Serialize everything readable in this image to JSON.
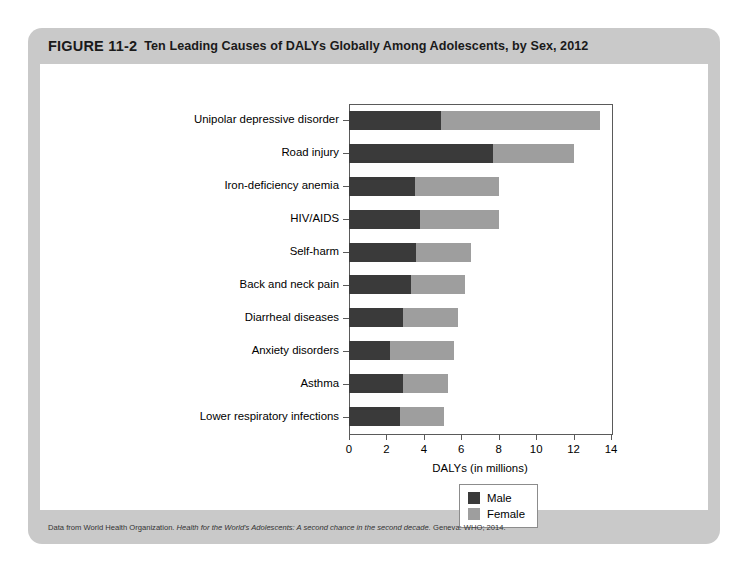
{
  "figure": {
    "number": "FIGURE 11-2",
    "title": "Ten Leading Causes of DALYs Globally Among Adolescents, by Sex, 2012",
    "source_note_prefix": "Data from World Health Organization. ",
    "source_note_italic": "Health for the World's Adolescents: A second chance in the second decade.",
    "source_note_suffix": " Geneva: WHO; 2014."
  },
  "colors": {
    "card_background": "#c9c9c9",
    "panel_background": "#ffffff",
    "male": "#3a3a3a",
    "female": "#9e9e9e",
    "axis": "#5a5a5a",
    "text": "#000000"
  },
  "legend": {
    "position": "bottom-center",
    "entries": [
      {
        "label": "Male",
        "color": "#3a3a3a"
      },
      {
        "label": "Female",
        "color": "#9e9e9e"
      }
    ]
  },
  "chart_data": {
    "type": "bar",
    "orientation": "horizontal",
    "stacked": true,
    "title": "Ten Leading Causes of DALYs Globally Among Adolescents, by Sex, 2012",
    "xlabel": "DALYs (in millions)",
    "ylabel": "",
    "xlim": [
      0,
      14
    ],
    "xticks": [
      0,
      2,
      4,
      6,
      8,
      10,
      12,
      14
    ],
    "xticklabels": [
      "0",
      "2",
      "4",
      "6",
      "8",
      "10",
      "12",
      "14"
    ],
    "grid": false,
    "categories": [
      "Unipolar depressive disorder",
      "Road injury",
      "Iron-deficiency anemia",
      "HIV/AIDS",
      "Self-harm",
      "Back and neck pain",
      "Diarrheal diseases",
      "Anxiety disorders",
      "Asthma",
      "Lower respiratory infections"
    ],
    "series": [
      {
        "name": "Male",
        "color": "#3a3a3a",
        "values": [
          4.9,
          7.7,
          3.5,
          3.8,
          3.6,
          3.3,
          2.9,
          2.2,
          2.9,
          2.7
        ]
      },
      {
        "name": "Female",
        "color": "#9e9e9e",
        "values": [
          8.5,
          4.3,
          4.5,
          4.2,
          2.9,
          2.9,
          2.9,
          3.4,
          2.4,
          2.4
        ]
      }
    ],
    "totals": [
      13.4,
      12.0,
      8.0,
      8.0,
      6.5,
      6.2,
      5.8,
      5.6,
      5.3,
      5.1
    ]
  }
}
